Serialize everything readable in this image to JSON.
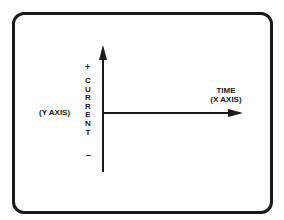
{
  "diagram": {
    "type": "axes",
    "y_axis": {
      "name": "(Y AXIS)",
      "quantity": "CURRENT",
      "quantity_letters": [
        "C",
        "U",
        "R",
        "R",
        "E",
        "N",
        "T"
      ],
      "positive_sign": "+",
      "negative_sign": "–",
      "arrow_direction": "up"
    },
    "x_axis": {
      "quantity": "TIME",
      "name": "(X AXIS)",
      "arrow_direction": "right"
    },
    "colors": {
      "ink": "#1a1a1a",
      "background": "#ffffff"
    }
  }
}
